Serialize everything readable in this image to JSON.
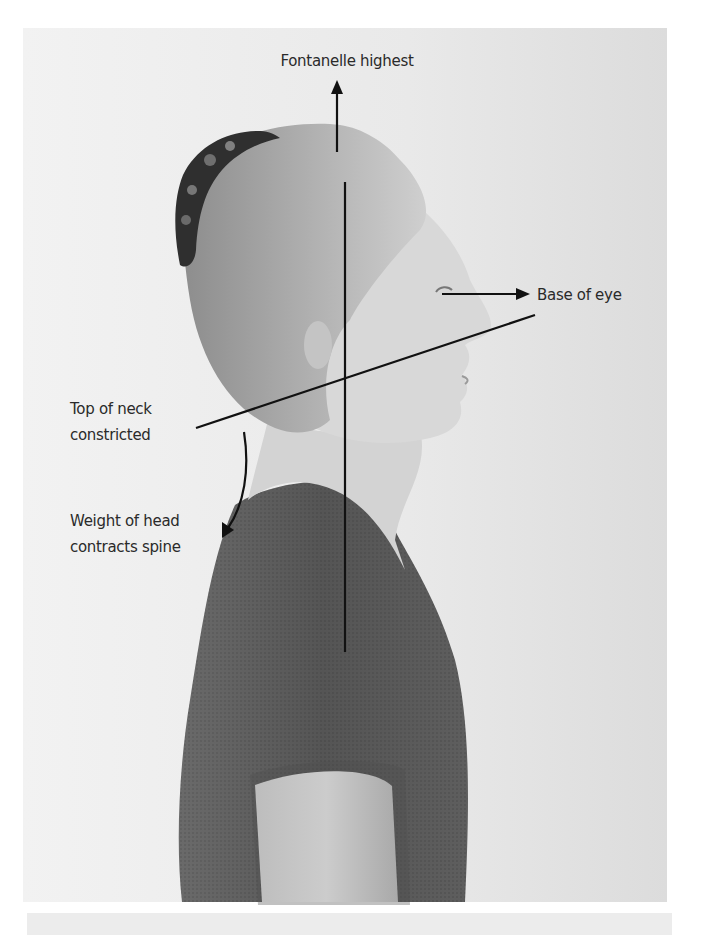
{
  "figure": {
    "photo": {
      "x": 23,
      "y": 28,
      "width": 644,
      "height": 874,
      "background": "#e9e9e9"
    },
    "colors": {
      "line": "#111111",
      "label_text": "#2a2a2a",
      "shirt": "#5a5a5a",
      "skin": "#cfcfcf",
      "hair": "#9a9a9a"
    }
  },
  "annotations": {
    "fontanelle": {
      "label": "Fontanelle highest"
    },
    "eye": {
      "label": "Base of eye"
    },
    "neck": {
      "line1": "Top of neck",
      "line2": "constricted"
    },
    "weight": {
      "line1": "Weight of head",
      "line2": "contracts spine"
    }
  },
  "icons": {
    "up_arrow": "arrow-up-icon",
    "right_arrow": "arrow-right-icon",
    "curved_arrow": "curved-arrow-down-icon"
  }
}
